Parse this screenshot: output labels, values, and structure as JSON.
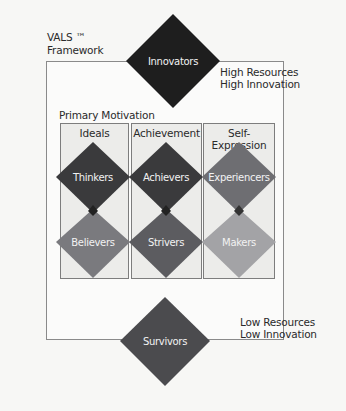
{
  "title": {
    "line1": "VALS ™",
    "line2": "Framework"
  },
  "top_axis": {
    "line1": "High Resources",
    "line2": "High Innovation"
  },
  "bottom_axis": {
    "line1": "Low Resources",
    "line2": "Low Innovation"
  },
  "primary_motivation_label": "Primary Motivation",
  "columns": [
    {
      "label": "Ideals",
      "upper": "Thinkers",
      "lower": "Believers"
    },
    {
      "label": "Achievement",
      "upper": "Achievers",
      "lower": "Strivers"
    },
    {
      "label": "Self-Expression",
      "upper": "Experiencers",
      "lower": "Makers"
    }
  ],
  "top_segment": "Innovators",
  "bottom_segment": "Survivors",
  "colors": {
    "innovators": "#1e1e1e",
    "thinkers": "#3a3a3c",
    "achievers": "#3a3a3c",
    "experiencers": "#6e6e72",
    "believers": "#7a7a7e",
    "strivers": "#5c5c60",
    "makers": "#a3a3a6",
    "survivors": "#4b4b4e",
    "column_fill": "#ececea",
    "frame_line": "#8a8a8a"
  }
}
